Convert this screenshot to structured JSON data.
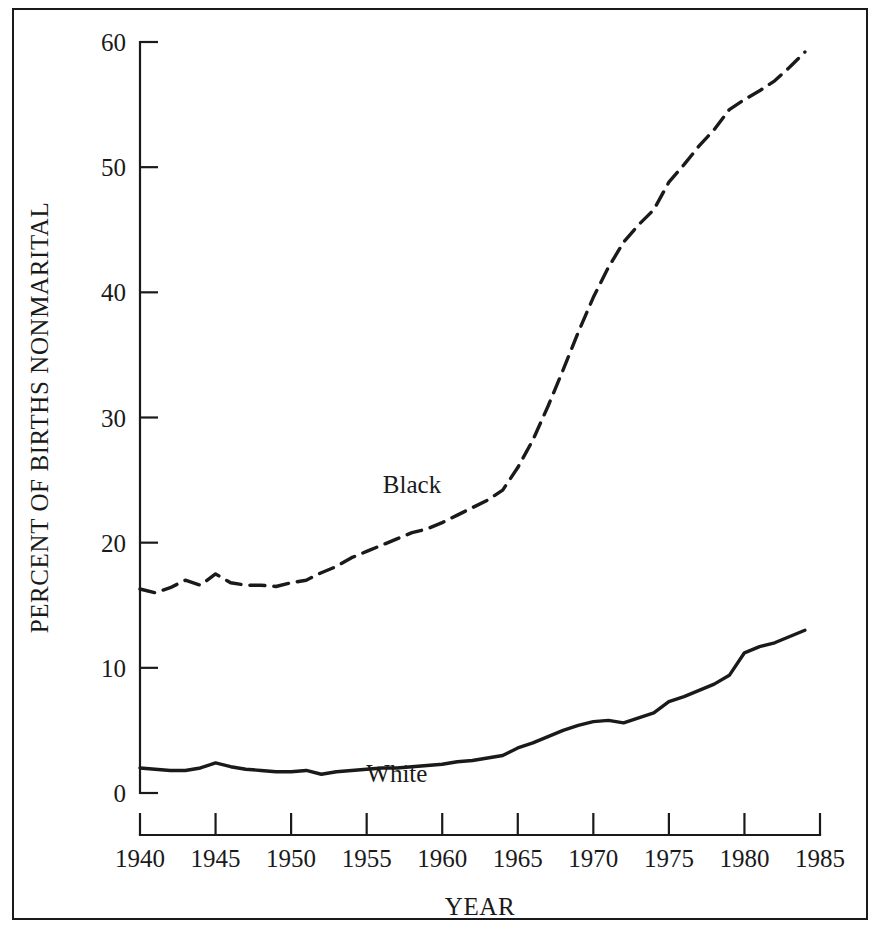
{
  "chart_data": {
    "type": "line",
    "title": "",
    "xlabel": "YEAR",
    "ylabel": "PERCENT OF BIRTHS NONMARITAL",
    "xlim": [
      1940,
      1985
    ],
    "ylim": [
      0,
      60
    ],
    "grid": false,
    "legend_position": "inline-annotation",
    "xticks": [
      1940,
      1945,
      1950,
      1955,
      1960,
      1965,
      1970,
      1975,
      1980,
      1985
    ],
    "xtick_labels": [
      "1940",
      "1945",
      "1950",
      "1955",
      "1960",
      "1965",
      "1970",
      "1975",
      "1980",
      "1985"
    ],
    "yticks": [
      0,
      10,
      20,
      30,
      40,
      50,
      60
    ],
    "ytick_labels": [
      "0",
      "10",
      "20",
      "30",
      "40",
      "50",
      "60"
    ],
    "x": [
      1940,
      1941,
      1942,
      1943,
      1944,
      1945,
      1946,
      1947,
      1948,
      1949,
      1950,
      1951,
      1952,
      1953,
      1954,
      1955,
      1956,
      1957,
      1958,
      1959,
      1960,
      1961,
      1962,
      1963,
      1964,
      1965,
      1966,
      1967,
      1968,
      1969,
      1970,
      1971,
      1972,
      1973,
      1974,
      1975,
      1976,
      1977,
      1978,
      1979,
      1980,
      1981,
      1982,
      1983,
      1984
    ],
    "series": [
      {
        "name": "Black",
        "style": "dashed",
        "color": "#1a1a1a",
        "label_year": 1958,
        "label_value": 24.0,
        "values": [
          16.3,
          16.0,
          16.4,
          17.0,
          16.6,
          17.5,
          16.8,
          16.6,
          16.6,
          16.5,
          16.8,
          17.0,
          17.6,
          18.1,
          18.8,
          19.3,
          19.8,
          20.3,
          20.8,
          21.1,
          21.6,
          22.2,
          22.8,
          23.4,
          24.2,
          26.0,
          28.2,
          30.9,
          33.8,
          36.8,
          39.6,
          42.0,
          44.0,
          45.4,
          46.6,
          48.8,
          50.2,
          51.7,
          53.0,
          54.6,
          55.4,
          56.1,
          56.9,
          58.0,
          59.2
        ]
      },
      {
        "name": "White",
        "style": "solid",
        "color": "#1a1a1a",
        "label_year": 1957,
        "label_value": 0.9,
        "values": [
          2.0,
          1.9,
          1.8,
          1.8,
          2.0,
          2.4,
          2.1,
          1.9,
          1.8,
          1.7,
          1.7,
          1.8,
          1.5,
          1.7,
          1.8,
          1.9,
          2.0,
          2.0,
          2.1,
          2.2,
          2.3,
          2.5,
          2.6,
          2.8,
          3.0,
          3.6,
          4.0,
          4.5,
          5.0,
          5.4,
          5.7,
          5.8,
          5.6,
          6.0,
          6.4,
          7.3,
          7.7,
          8.2,
          8.7,
          9.4,
          11.2,
          11.7,
          12.0,
          12.5,
          13.0
        ]
      }
    ]
  },
  "series_labels": {
    "black": "Black",
    "white": "White"
  },
  "axis": {
    "x_title": "YEAR",
    "y_title": "PERCENT OF BIRTHS NONMARITAL"
  }
}
